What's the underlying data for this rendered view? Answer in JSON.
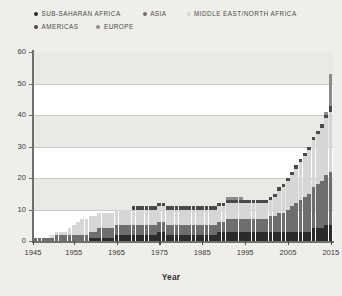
{
  "legend": {
    "items": [
      {
        "label": "SUB-SAHARAN AFRICA",
        "color": "#2b2b2b"
      },
      {
        "label": "ASIA",
        "color": "#6e6e6e"
      },
      {
        "label": "MIDDLE EAST/NORTH AFRICA",
        "color": "#d6d6d6"
      },
      {
        "label": "AMERICAS",
        "color": "#4a4a4a"
      },
      {
        "label": "EUROPE",
        "color": "#8c8c8c"
      }
    ]
  },
  "axes": {
    "y_ticks": [
      "0",
      "10",
      "20",
      "30",
      "40",
      "50",
      "60"
    ],
    "x_ticks": [
      "1945",
      "1955",
      "1965",
      "1975",
      "1985",
      "1995",
      "2005",
      "2015"
    ],
    "x_title": "Year"
  },
  "chart_data": {
    "type": "bar",
    "stacked": true,
    "title": "",
    "xlabel": "Year",
    "ylabel": "",
    "ylim": [
      0,
      60
    ],
    "ytick_step": 10,
    "grid": true,
    "legend_position": "top",
    "x": [
      1946,
      1947,
      1948,
      1949,
      1950,
      1951,
      1952,
      1953,
      1954,
      1955,
      1956,
      1957,
      1958,
      1959,
      1960,
      1961,
      1962,
      1963,
      1964,
      1965,
      1966,
      1967,
      1968,
      1969,
      1970,
      1971,
      1972,
      1973,
      1974,
      1975,
      1976,
      1977,
      1978,
      1979,
      1980,
      1981,
      1982,
      1983,
      1984,
      1985,
      1986,
      1987,
      1988,
      1989,
      1990,
      1991,
      1992,
      1993,
      1994,
      1995,
      1996,
      1997,
      1998,
      1999,
      2000,
      2001,
      2002,
      2003,
      2004,
      2005,
      2006,
      2007,
      2008,
      2009,
      2010,
      2011,
      2012,
      2013,
      2014,
      2015
    ],
    "categories": [
      "1946",
      "1947",
      "1948",
      "1949",
      "1950",
      "1951",
      "1952",
      "1953",
      "1954",
      "1955",
      "1956",
      "1957",
      "1958",
      "1959",
      "1960",
      "1961",
      "1962",
      "1963",
      "1964",
      "1965",
      "1966",
      "1967",
      "1968",
      "1969",
      "1970",
      "1971",
      "1972",
      "1973",
      "1974",
      "1975",
      "1976",
      "1977",
      "1978",
      "1979",
      "1980",
      "1981",
      "1982",
      "1983",
      "1984",
      "1985",
      "1986",
      "1987",
      "1988",
      "1989",
      "1990",
      "1991",
      "1992",
      "1993",
      "1994",
      "1995",
      "1996",
      "1997",
      "1998",
      "1999",
      "2000",
      "2001",
      "2002",
      "2003",
      "2004",
      "2005",
      "2006",
      "2007",
      "2008",
      "2009",
      "2010",
      "2011",
      "2012",
      "2013",
      "2014",
      "2015"
    ],
    "series": [
      {
        "name": "SUB-SAHARAN AFRICA",
        "color": "#2b2b2b",
        "values": [
          0,
          0,
          0,
          0,
          0,
          0,
          0,
          0,
          0,
          0,
          0,
          0,
          0,
          1,
          1,
          1,
          1,
          1,
          1,
          2,
          2,
          2,
          2,
          2,
          2,
          2,
          2,
          2,
          2,
          3,
          3,
          2,
          2,
          2,
          2,
          2,
          2,
          2,
          2,
          2,
          2,
          2,
          2,
          3,
          3,
          3,
          3,
          3,
          3,
          3,
          3,
          3,
          3,
          3,
          3,
          3,
          3,
          3,
          3,
          3,
          3,
          3,
          3,
          3,
          3,
          4,
          4,
          4,
          5,
          5
        ]
      },
      {
        "name": "ASIA",
        "color": "#6e6e6e",
        "values": [
          1,
          1,
          1,
          1,
          1,
          2,
          2,
          2,
          2,
          2,
          2,
          2,
          2,
          2,
          2,
          3,
          3,
          3,
          3,
          3,
          3,
          3,
          3,
          3,
          3,
          3,
          3,
          3,
          3,
          3,
          3,
          3,
          3,
          3,
          3,
          3,
          3,
          3,
          3,
          3,
          3,
          3,
          3,
          3,
          3,
          4,
          4,
          4,
          4,
          4,
          4,
          4,
          4,
          4,
          4,
          5,
          5,
          6,
          6,
          7,
          8,
          9,
          10,
          11,
          12,
          13,
          14,
          15,
          16,
          17
        ]
      },
      {
        "name": "MIDDLE EAST/NORTH AFRICA",
        "color": "#d6d6d6",
        "values": [
          0,
          0,
          0,
          0,
          1,
          1,
          1,
          1,
          2,
          3,
          4,
          5,
          5,
          5,
          5,
          5,
          5,
          5,
          5,
          5,
          5,
          5,
          5,
          5,
          5,
          5,
          5,
          5,
          5,
          5,
          5,
          5,
          5,
          5,
          5,
          5,
          5,
          5,
          5,
          5,
          5,
          5,
          5,
          5,
          5,
          5,
          5,
          5,
          5,
          5,
          5,
          5,
          5,
          5,
          5,
          5,
          6,
          7,
          8,
          9,
          10,
          11,
          12,
          13,
          14,
          15,
          16,
          17,
          18,
          19
        ]
      },
      {
        "name": "AMERICAS",
        "color": "#4a4a4a",
        "values": [
          0,
          0,
          0,
          0,
          0,
          0,
          0,
          0,
          0,
          0,
          0,
          0,
          0,
          0,
          0,
          0,
          0,
          0,
          0,
          0,
          0,
          0,
          0,
          1,
          1,
          1,
          1,
          1,
          1,
          1,
          1,
          1,
          1,
          1,
          1,
          1,
          1,
          1,
          1,
          1,
          1,
          1,
          1,
          1,
          1,
          1,
          1,
          1,
          1,
          1,
          1,
          1,
          1,
          1,
          1,
          1,
          1,
          1,
          1,
          1,
          1,
          1,
          1,
          1,
          1,
          1,
          1,
          1,
          1,
          2
        ]
      },
      {
        "name": "EUROPE",
        "color": "#8c8c8c",
        "values": [
          0,
          0,
          0,
          0,
          0,
          0,
          0,
          0,
          0,
          0,
          0,
          0,
          0,
          0,
          0,
          0,
          0,
          0,
          0,
          0,
          0,
          0,
          0,
          0,
          0,
          0,
          0,
          0,
          0,
          0,
          0,
          0,
          0,
          0,
          0,
          0,
          0,
          0,
          0,
          0,
          0,
          0,
          0,
          0,
          0,
          1,
          1,
          1,
          1,
          0,
          0,
          0,
          0,
          0,
          0,
          0,
          0,
          0,
          0,
          0,
          0,
          0,
          0,
          0,
          0,
          0,
          0,
          0,
          1,
          10
        ]
      }
    ],
    "totals": [
      1,
      1,
      1,
      1,
      2,
      3,
      3,
      3,
      4,
      5,
      6,
      7,
      7,
      8,
      8,
      9,
      9,
      9,
      9,
      10,
      10,
      10,
      10,
      11,
      11,
      11,
      11,
      11,
      11,
      12,
      12,
      11,
      11,
      11,
      11,
      11,
      11,
      11,
      11,
      11,
      11,
      11,
      11,
      12,
      12,
      14,
      14,
      14,
      14,
      13,
      13,
      13,
      13,
      13,
      13,
      14,
      15,
      17,
      18,
      20,
      22,
      24,
      26,
      28,
      30,
      34,
      35,
      37,
      41,
      53
    ]
  }
}
